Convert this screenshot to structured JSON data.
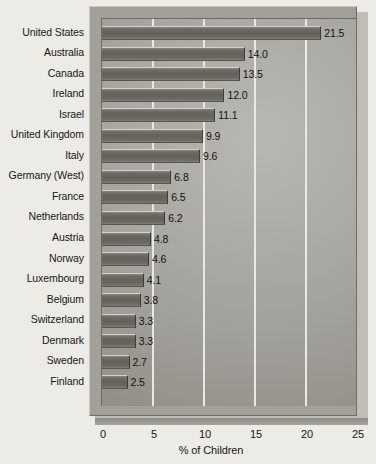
{
  "chart_data": {
    "type": "bar",
    "orientation": "horizontal",
    "title": "",
    "subtitle": "",
    "xlabel": "% of Children",
    "ylabel": "",
    "xlim": [
      0,
      25
    ],
    "xticks": [
      0,
      5,
      10,
      15,
      20,
      25
    ],
    "xtick_labels": [
      "0",
      "5",
      "10",
      "15",
      "20",
      "25"
    ],
    "grid": "vertical",
    "legend": "none",
    "categories": [
      "United States",
      "Australia",
      "Canada",
      "Ireland",
      "Israel",
      "United Kingdom",
      "Italy",
      "Germany (West)",
      "France",
      "Netherlands",
      "Austria",
      "Norway",
      "Luxembourg",
      "Belgium",
      "Switzerland",
      "Denmark",
      "Sweden",
      "Finland"
    ],
    "values": [
      21.5,
      14.0,
      13.5,
      12.0,
      11.1,
      9.9,
      9.6,
      6.8,
      6.5,
      6.2,
      4.8,
      4.6,
      4.1,
      3.8,
      3.3,
      3.3,
      2.7,
      2.5
    ],
    "value_labels": [
      "21.5",
      "14.0",
      "13.5",
      "12.0",
      "11.1",
      "9.9",
      "9.6",
      "6.8",
      "6.5",
      "6.2",
      "4.8",
      "4.6",
      "4.1",
      "3.8",
      "3.3",
      "3.3",
      "2.7",
      "2.5"
    ]
  },
  "colors": {
    "page_background": "#edebe5",
    "plot_frame": "#a3a099",
    "plot_area_light": "#b9b7b1",
    "plot_area_dark": "#8b8982",
    "bar_fill": "#636159",
    "gridline": "#e9e8e3",
    "text": "#141414"
  }
}
